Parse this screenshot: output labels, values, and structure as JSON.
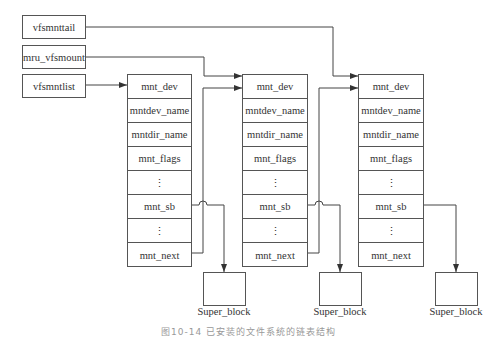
{
  "heads": [
    {
      "label": "vfsmnttail"
    },
    {
      "label": "mru_vfsmount"
    },
    {
      "label": "vfsmntlist"
    }
  ],
  "structs": [
    {
      "fields": [
        "mnt_dev",
        "mntdev_name",
        "mntdir_name",
        "mnt_flags",
        "⋮",
        "mnt_sb",
        "⋮",
        "mnt_next"
      ]
    },
    {
      "fields": [
        "mnt_dev",
        "mntdev_name",
        "mntdir_name",
        "mnt_flags",
        "⋮",
        "mnt_sb",
        "⋮",
        "mnt_next"
      ]
    },
    {
      "fields": [
        "mnt_dev",
        "mntdev_name",
        "mntdir_name",
        "mnt_flags",
        "⋮",
        "mnt_sb",
        "⋮",
        "mnt_next"
      ]
    }
  ],
  "super_blocks": [
    {
      "label": "Super_block"
    },
    {
      "label": "Super_block"
    },
    {
      "label": "Super_block"
    }
  ],
  "caption": "图10-14  已安装的文件系统的链表结构",
  "colors": {
    "line": "#444444",
    "border": "#555555"
  }
}
